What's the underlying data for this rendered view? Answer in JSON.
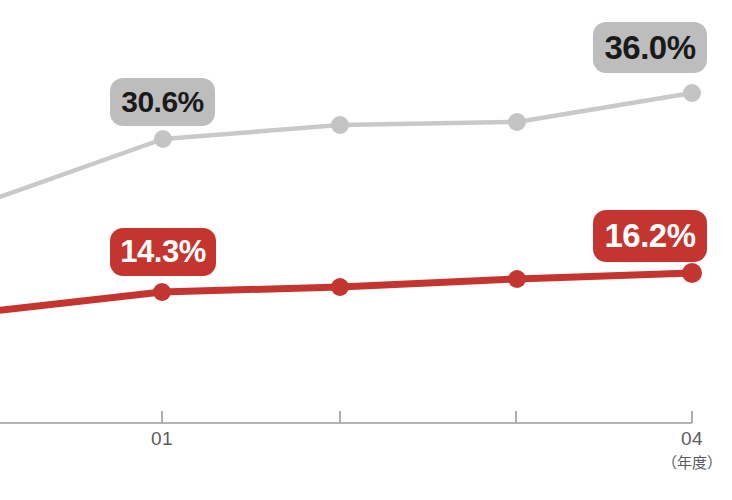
{
  "chart_data": {
    "type": "line",
    "title": "",
    "subtitle": "",
    "xlabel": "（年度）",
    "ylabel": "",
    "grid": false,
    "legend": "none",
    "x_axis": {
      "tick_labels": [
        "01",
        "",
        "",
        "04"
      ],
      "unit_note": "（年度）",
      "tick_positions_px": [
        162,
        340,
        516,
        692
      ],
      "axis_line_color": "#9b9b9b"
    },
    "series": [
      {
        "name": "gray-series",
        "color": "#c9c9c9",
        "marker_color": "#c4c4c4",
        "values": [
          null,
          30.6,
          null,
          null,
          36.0
        ],
        "point_positions_px": [
          {
            "x": -6,
            "y": 199
          },
          {
            "x": 163,
            "y": 139
          },
          {
            "x": 340,
            "y": 125
          },
          {
            "x": 517,
            "y": 122
          },
          {
            "x": 692,
            "y": 93
          }
        ],
        "labels": [
          {
            "text": "30.6%",
            "value": 30.6,
            "at_index": 1
          },
          {
            "text": "36.0%",
            "value": 36.0,
            "at_index": 4
          }
        ]
      },
      {
        "name": "red-series",
        "color": "#c5352f",
        "marker_color": "#c5352f",
        "values": [
          null,
          14.3,
          null,
          null,
          16.2
        ],
        "point_positions_px": [
          {
            "x": -6,
            "y": 311
          },
          {
            "x": 162,
            "y": 292
          },
          {
            "x": 340,
            "y": 287
          },
          {
            "x": 517,
            "y": 279
          },
          {
            "x": 692,
            "y": 273
          }
        ],
        "labels": [
          {
            "text": "14.3%",
            "value": 14.3,
            "at_index": 1
          },
          {
            "text": "16.2%",
            "value": 16.2,
            "at_index": 4
          }
        ]
      }
    ],
    "annotations": [
      {
        "id": "gray-left",
        "text": "30.6%",
        "style": "gray"
      },
      {
        "id": "gray-right",
        "text": "36.0%",
        "style": "gray"
      },
      {
        "id": "red-left",
        "text": "14.3%",
        "style": "red"
      },
      {
        "id": "red-right",
        "text": "16.2%",
        "style": "red"
      }
    ]
  },
  "badges": {
    "gray_left": "30.6%",
    "gray_right": "36.0%",
    "red_left": "14.3%",
    "red_right": "16.2%"
  },
  "axis": {
    "tick_01": "01",
    "tick_04": "04",
    "unit": "（年度）"
  },
  "colors": {
    "red": "#c5352f",
    "gray_line": "#c9c9c9",
    "gray_badge": "#bdbdbd",
    "axis": "#9b9b9b",
    "tick_text": "#5b5b5f",
    "background": "#ffffff"
  }
}
